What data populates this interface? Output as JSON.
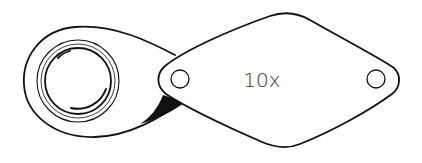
{
  "image": {
    "subject": "jeweler's loupe magnifier line drawing",
    "magnification_label": "10x",
    "colors": {
      "background": "#ffffff",
      "ink": "#111111",
      "label": "#333333"
    }
  }
}
